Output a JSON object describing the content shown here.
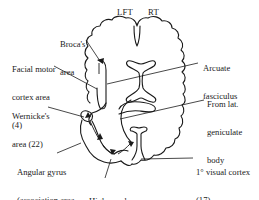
{
  "diagram": {
    "view": "Horizontal brain section (top-down)",
    "colors": {
      "ink": "#1a1a1a",
      "background": "#ffffff"
    },
    "hemisphere_labels": {
      "left": "LFT",
      "right": "RT"
    },
    "labels": {
      "broca": {
        "line1": "Broca's",
        "line2": "area"
      },
      "facial_motor": {
        "line1": "Facial motor",
        "line2": "cortex area",
        "line3": "(4)"
      },
      "wernicke": {
        "line1": "Wernicke's",
        "line2": "area (22)"
      },
      "angular_gyrus": {
        "line1": "Angular gyrus",
        "line2": "(association area",
        "line3": "39)"
      },
      "higher_visual": {
        "line1": "Higher order",
        "line2": "visual area (18)"
      },
      "arcuate": {
        "line1": "Arcuate",
        "line2": "fasciculus"
      },
      "lat_geniculate": {
        "line1": "From lat.",
        "line2": "geniculate",
        "line3": "body"
      },
      "primary_visual": {
        "line1": "1° visual cortex",
        "line2": "(17)"
      }
    },
    "pathway_order": [
      "From lat. geniculate body",
      "1° visual cortex (17)",
      "Higher order visual area (18)",
      "Angular gyrus (39)",
      "Wernicke's area (22)",
      "Arcuate fasciculus",
      "Broca's area",
      "Facial motor cortex area (4)"
    ]
  }
}
